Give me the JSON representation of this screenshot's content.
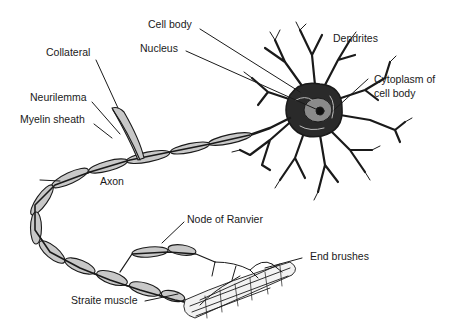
{
  "diagram": {
    "labels": {
      "cell_body": "Cell body",
      "nucleus": "Nucleus",
      "dendrites": "Dendrites",
      "cytoplasm_line1": "Cytoplasm of",
      "cytoplasm_line2": "cell body",
      "collateral": "Collateral",
      "neurilemma": "Neurilemma",
      "myelin_sheath": "Myelin sheath",
      "axon": "Axon",
      "node_of_ranvier": "Node of Ranvier",
      "end_brushes": "End brushes",
      "straite_muscle": "Straite muscle"
    },
    "colors": {
      "ink": "#1a1a1a",
      "myelin_fill": "#c8c8c8",
      "background": "#ffffff"
    }
  }
}
